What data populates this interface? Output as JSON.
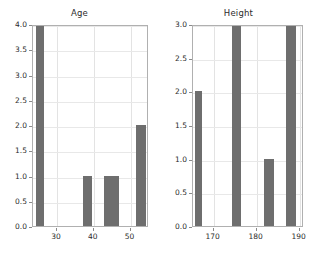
{
  "figure": {
    "width": 318,
    "height": 256,
    "background": "#ffffff",
    "bar_color": "#6e6e6e",
    "axis_color": "#b0b0b0",
    "grid_color": "#e3e3e3",
    "text_color": "#2b2b2b"
  },
  "chart_data": [
    {
      "type": "bar",
      "title": "Age",
      "xlabel": "",
      "ylabel": "",
      "grid": true,
      "legend": "none",
      "xlim": [
        23.5,
        55.0
      ],
      "ylim": [
        0.0,
        4.0
      ],
      "xticks": [
        30,
        40,
        50
      ],
      "xtick_labels": [
        "30",
        "40",
        "50"
      ],
      "yticks": [
        0.0,
        0.5,
        1.0,
        1.5,
        2.0,
        2.5,
        3.0,
        3.5,
        4.0
      ],
      "ytick_labels": [
        "0.0",
        "0.5",
        "1.0",
        "1.5",
        "2.0",
        "2.5",
        "3.0",
        "3.5",
        "4.0"
      ],
      "bars": [
        {
          "left": 24.3,
          "right": 26.5,
          "value": 4.0
        },
        {
          "left": 37.2,
          "right": 39.6,
          "value": 1.0
        },
        {
          "left": 42.8,
          "right": 46.9,
          "value": 1.0
        },
        {
          "left": 51.6,
          "right": 54.2,
          "value": 2.0
        }
      ]
    },
    {
      "type": "bar",
      "title": "Height",
      "xlabel": "",
      "ylabel": "",
      "grid": true,
      "legend": "none",
      "xlim": [
        165.2,
        191.0
      ],
      "ylim": [
        0.0,
        3.0
      ],
      "xticks": [
        170,
        180,
        190
      ],
      "xtick_labels": [
        "170",
        "180",
        "190"
      ],
      "yticks": [
        0.0,
        0.5,
        1.0,
        1.5,
        2.0,
        2.5,
        3.0
      ],
      "ytick_labels": [
        "0.0",
        "0.5",
        "1.0",
        "1.5",
        "2.0",
        "2.5",
        "3.0"
      ],
      "bars": [
        {
          "left": 165.6,
          "right": 167.4,
          "value": 2.0
        },
        {
          "left": 174.3,
          "right": 176.4,
          "value": 3.0
        },
        {
          "left": 181.8,
          "right": 184.0,
          "value": 1.0
        },
        {
          "left": 186.8,
          "right": 189.2,
          "value": 3.0
        }
      ]
    }
  ]
}
